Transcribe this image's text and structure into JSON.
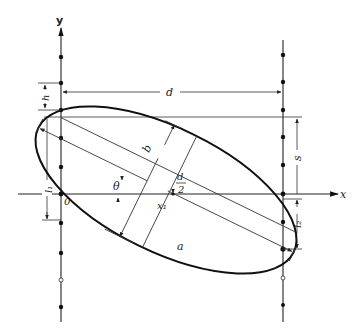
{
  "diagram": {
    "type": "geometry-construction",
    "axes": {
      "y_label": "y",
      "x_label": "x",
      "origin_label": "0"
    },
    "labels": {
      "d": "d",
      "h": "h",
      "s": "s",
      "l1": "l₁",
      "l2": "l₂",
      "b": "b",
      "a": "a",
      "theta": "θ",
      "x1": "x₁",
      "d_half_num": "d",
      "d_half_den": "2"
    },
    "left_column_points": [
      {
        "y": 57,
        "type": "filled"
      },
      {
        "y": 83,
        "type": "filled"
      },
      {
        "y": 110,
        "type": "filled"
      },
      {
        "y": 138,
        "type": "filled"
      },
      {
        "y": 167,
        "type": "filled"
      },
      {
        "y": 194,
        "type": "filled"
      },
      {
        "y": 226,
        "type": "filled"
      },
      {
        "y": 253,
        "type": "filled"
      },
      {
        "y": 280,
        "type": "hollow"
      },
      {
        "y": 307,
        "type": "filled"
      }
    ],
    "right_column_points": [
      {
        "y": 55,
        "type": "filled"
      },
      {
        "y": 82,
        "type": "filled"
      },
      {
        "y": 110,
        "type": "filled"
      },
      {
        "y": 137,
        "type": "filled"
      },
      {
        "y": 165,
        "type": "filled"
      },
      {
        "y": 194,
        "type": "filled"
      },
      {
        "y": 222,
        "type": "filled"
      },
      {
        "y": 249,
        "type": "filled"
      },
      {
        "y": 278,
        "type": "hollow"
      },
      {
        "y": 305,
        "type": "filled"
      }
    ],
    "colors": {
      "ink": "#111111",
      "background": "#ffffff"
    }
  }
}
